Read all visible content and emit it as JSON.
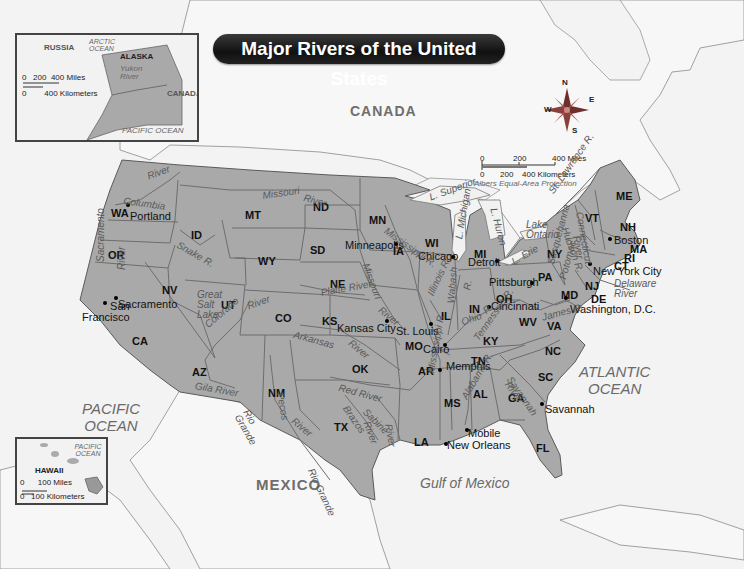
{
  "title": "Major Rivers of the United States",
  "colors": {
    "land_us": "#a9a9a9",
    "land_other": "#f6f6f6",
    "water": "#f3f3f3",
    "border": "#555555",
    "river": "#6e6e6e",
    "compass": "#8a3f3a",
    "title_bg": "#1a1a1a"
  },
  "countries": {
    "canada": "CANADA",
    "mexico": "MEXICO"
  },
  "oceans": {
    "pacific": "PACIFIC\nOCEAN",
    "atlantic": "ATLANTIC\nOCEAN",
    "gulf": "Gulf of Mexico"
  },
  "compass": {
    "n": "N",
    "e": "E",
    "s": "S",
    "w": "W"
  },
  "scale": {
    "miles_0": "0",
    "miles_200": "200",
    "miles_400": "400 Miles",
    "km_0": "0",
    "km_200": "200",
    "km_400": "400 Kilometers",
    "projection": "Albers Equal-Area Projection"
  },
  "alaska_inset": {
    "russia": "RUSSIA",
    "arctic": "ARCTIC OCEAN",
    "alaska": "ALASKA",
    "yukon": "Yukon River",
    "canada": "CANADA",
    "pacific": "PACIFIC OCEAN",
    "scale_miles": "0   200  400 Miles",
    "scale_km": "0        400 Kilometers"
  },
  "hawaii_inset": {
    "pacific": "PACIFIC OCEAN",
    "hawaii": "HAWAII",
    "scale_miles": "0      100 Miles",
    "scale_km": "0   100 Kilometers"
  },
  "states": [
    {
      "abbr": "WA",
      "x": 111,
      "y": 208
    },
    {
      "abbr": "OR",
      "x": 108,
      "y": 250
    },
    {
      "abbr": "CA",
      "x": 132,
      "y": 336
    },
    {
      "abbr": "ID",
      "x": 191,
      "y": 230
    },
    {
      "abbr": "NV",
      "x": 162,
      "y": 285
    },
    {
      "abbr": "MT",
      "x": 245,
      "y": 210
    },
    {
      "abbr": "WY",
      "x": 258,
      "y": 256
    },
    {
      "abbr": "UT",
      "x": 221,
      "y": 300
    },
    {
      "abbr": "AZ",
      "x": 192,
      "y": 367
    },
    {
      "abbr": "CO",
      "x": 275,
      "y": 313
    },
    {
      "abbr": "NM",
      "x": 268,
      "y": 388
    },
    {
      "abbr": "ND",
      "x": 313,
      "y": 202
    },
    {
      "abbr": "SD",
      "x": 310,
      "y": 245
    },
    {
      "abbr": "NE",
      "x": 330,
      "y": 279
    },
    {
      "abbr": "KS",
      "x": 322,
      "y": 316
    },
    {
      "abbr": "OK",
      "x": 352,
      "y": 364
    },
    {
      "abbr": "TX",
      "x": 334,
      "y": 422
    },
    {
      "abbr": "MN",
      "x": 369,
      "y": 215
    },
    {
      "abbr": "IA",
      "x": 393,
      "y": 246
    },
    {
      "abbr": "MO",
      "x": 405,
      "y": 341
    },
    {
      "abbr": "AR",
      "x": 418,
      "y": 366
    },
    {
      "abbr": "LA",
      "x": 414,
      "y": 437
    },
    {
      "abbr": "WI",
      "x": 425,
      "y": 238
    },
    {
      "abbr": "IL",
      "x": 441,
      "y": 311
    },
    {
      "abbr": "MI",
      "x": 474,
      "y": 249
    },
    {
      "abbr": "IN",
      "x": 469,
      "y": 304
    },
    {
      "abbr": "OH",
      "x": 496,
      "y": 294
    },
    {
      "abbr": "KY",
      "x": 483,
      "y": 336
    },
    {
      "abbr": "TN",
      "x": 471,
      "y": 356
    },
    {
      "abbr": "MS",
      "x": 444,
      "y": 398
    },
    {
      "abbr": "AL",
      "x": 473,
      "y": 389
    },
    {
      "abbr": "GA",
      "x": 508,
      "y": 393
    },
    {
      "abbr": "FL",
      "x": 536,
      "y": 443
    },
    {
      "abbr": "SC",
      "x": 538,
      "y": 372
    },
    {
      "abbr": "NC",
      "x": 545,
      "y": 346
    },
    {
      "abbr": "VA",
      "x": 547,
      "y": 321
    },
    {
      "abbr": "WV",
      "x": 519,
      "y": 317
    },
    {
      "abbr": "PA",
      "x": 538,
      "y": 272
    },
    {
      "abbr": "NY",
      "x": 547,
      "y": 249
    },
    {
      "abbr": "VT",
      "x": 585,
      "y": 213
    },
    {
      "abbr": "NH",
      "x": 620,
      "y": 222
    },
    {
      "abbr": "ME",
      "x": 616,
      "y": 191
    },
    {
      "abbr": "MA",
      "x": 630,
      "y": 244
    },
    {
      "abbr": "RI",
      "x": 624,
      "y": 253
    },
    {
      "abbr": "CT",
      "x": 614,
      "y": 261
    },
    {
      "abbr": "NJ",
      "x": 585,
      "y": 281
    },
    {
      "abbr": "DE",
      "x": 591,
      "y": 294
    },
    {
      "abbr": "MD",
      "x": 561,
      "y": 290
    }
  ],
  "cities": [
    {
      "name": "Portland",
      "x": 130,
      "y": 211,
      "dx": 128,
      "dy": 205
    },
    {
      "name": "Sacramento",
      "x": 118,
      "y": 299,
      "dx": 116,
      "dy": 298
    },
    {
      "name": "San\nFrancisco",
      "x": 82,
      "y": 301,
      "dx": 105,
      "dy": 303,
      "align": "right"
    },
    {
      "name": "Minneapolis",
      "x": 345,
      "y": 240,
      "dx": 396,
      "dy": 244
    },
    {
      "name": "Chicago",
      "x": 418,
      "y": 251,
      "dx": 453,
      "dy": 257
    },
    {
      "name": "Detroit",
      "x": 468,
      "y": 257,
      "dx": 497,
      "dy": 261
    },
    {
      "name": "Pittsburgh",
      "x": 489,
      "y": 277,
      "dx": 532,
      "dy": 283
    },
    {
      "name": "Cincinnati",
      "x": 491,
      "y": 301,
      "dx": 489,
      "dy": 307
    },
    {
      "name": "Kansas City",
      "x": 337,
      "y": 323,
      "dx": 387,
      "dy": 321
    },
    {
      "name": "St. Louis",
      "x": 396,
      "y": 326,
      "dx": 431,
      "dy": 324
    },
    {
      "name": "Cairo",
      "x": 423,
      "y": 344,
      "dx": 445,
      "dy": 345
    },
    {
      "name": "Memphis",
      "x": 446,
      "y": 361,
      "dx": 440,
      "dy": 370
    },
    {
      "name": "Mobile",
      "x": 468,
      "y": 428,
      "dx": 467,
      "dy": 430
    },
    {
      "name": "New Orleans",
      "x": 447,
      "y": 440,
      "dx": 446,
      "dy": 444
    },
    {
      "name": "Savannah",
      "x": 545,
      "y": 404,
      "dx": 542,
      "dy": 404
    },
    {
      "name": "Boston",
      "x": 614,
      "y": 235,
      "dx": 610,
      "dy": 239
    },
    {
      "name": "New York City",
      "x": 593,
      "y": 266,
      "dx": 590,
      "dy": 264
    },
    {
      "name": "Washington, D.C.",
      "x": 570,
      "y": 304,
      "dx": 566,
      "dy": 298
    }
  ],
  "rivers": [
    {
      "name": "Columbia",
      "x": 124,
      "y": 196,
      "rot": 8
    },
    {
      "name": "River",
      "x": 146,
      "y": 172,
      "rot": -20
    },
    {
      "name": "Snake R.",
      "x": 180,
      "y": 240,
      "rot": 30
    },
    {
      "name": "Missouri",
      "x": 262,
      "y": 191,
      "rot": -8
    },
    {
      "name": "River",
      "x": 305,
      "y": 193,
      "rot": 15
    },
    {
      "name": "Sacramento",
      "x": 96,
      "y": 262,
      "rot": -90
    },
    {
      "name": "River",
      "x": 117,
      "y": 270,
      "rot": -90
    },
    {
      "name": "Great\nSalt\nLake",
      "x": 197,
      "y": 290,
      "rot": 0
    },
    {
      "name": "Colorado",
      "x": 203,
      "y": 322,
      "rot": -40
    },
    {
      "name": "River",
      "x": 246,
      "y": 302,
      "rot": -20
    },
    {
      "name": "Arkansas",
      "x": 295,
      "y": 330,
      "rot": 15
    },
    {
      "name": "River",
      "x": 353,
      "y": 338,
      "rot": 40
    },
    {
      "name": "Platte River",
      "x": 320,
      "y": 288,
      "rot": -10
    },
    {
      "name": "Missouri",
      "x": 370,
      "y": 262,
      "rot": 70
    },
    {
      "name": "River",
      "x": 383,
      "y": 305,
      "rot": 40
    },
    {
      "name": "Mississippi R.",
      "x": 388,
      "y": 226,
      "rot": 35
    },
    {
      "name": "Gila River",
      "x": 196,
      "y": 381,
      "rot": 10
    },
    {
      "name": "Rio\nGrande",
      "x": 250,
      "y": 408,
      "rot": 60
    },
    {
      "name": "Pecos",
      "x": 285,
      "y": 392,
      "rot": 80
    },
    {
      "name": "River",
      "x": 296,
      "y": 416,
      "rot": 40
    },
    {
      "name": "Red River",
      "x": 340,
      "y": 383,
      "rot": 15
    },
    {
      "name": "Brazos",
      "x": 349,
      "y": 404,
      "rot": 55
    },
    {
      "name": "River",
      "x": 371,
      "y": 420,
      "rot": 70
    },
    {
      "name": "Sabine",
      "x": 368,
      "y": 407,
      "rot": 45
    },
    {
      "name": "River",
      "x": 393,
      "y": 423,
      "rot": 80
    },
    {
      "name": "Rio Grande",
      "x": 315,
      "y": 467,
      "rot": 65
    },
    {
      "name": "L. Superior",
      "x": 428,
      "y": 193,
      "rot": -20
    },
    {
      "name": "L. Michigan",
      "x": 454,
      "y": 238,
      "rot": -80
    },
    {
      "name": "L. Huron",
      "x": 498,
      "y": 207,
      "rot": 75
    },
    {
      "name": "L. Erie",
      "x": 510,
      "y": 258,
      "rot": -30
    },
    {
      "name": "Lake\nOntario",
      "x": 526,
      "y": 220,
      "rot": 0
    },
    {
      "name": "St. Lawrence R.",
      "x": 547,
      "y": 190,
      "rot": -55
    },
    {
      "name": "Illinois R.",
      "x": 426,
      "y": 293,
      "rot": -65
    },
    {
      "name": "Wabash",
      "x": 446,
      "y": 303,
      "rot": -85
    },
    {
      "name": "R.",
      "x": 462,
      "y": 289,
      "rot": -80
    },
    {
      "name": "Ohio",
      "x": 460,
      "y": 318,
      "rot": -20
    },
    {
      "name": "R.",
      "x": 481,
      "y": 308,
      "rot": -40
    },
    {
      "name": "Tennessee R.",
      "x": 472,
      "y": 337,
      "rot": -55
    },
    {
      "name": "Mississippi R.",
      "x": 426,
      "y": 372,
      "rot": -80
    },
    {
      "name": "Alabama R.",
      "x": 460,
      "y": 396,
      "rot": -60
    },
    {
      "name": "Savannah",
      "x": 513,
      "y": 375,
      "rot": 55
    },
    {
      "name": "River",
      "x": 511,
      "y": 380,
      "rot": 55
    },
    {
      "name": "Susquehanna",
      "x": 546,
      "y": 263,
      "rot": -75
    },
    {
      "name": "Hudson R.",
      "x": 569,
      "y": 226,
      "rot": 70
    },
    {
      "name": "River",
      "x": 581,
      "y": 235,
      "rot": 80
    },
    {
      "name": "Connecticut",
      "x": 584,
      "y": 211,
      "rot": 80
    },
    {
      "name": "Potomac",
      "x": 558,
      "y": 278,
      "rot": -75
    },
    {
      "name": "James R.",
      "x": 541,
      "y": 313,
      "rot": -15
    },
    {
      "name": "Delaware\nRiver",
      "x": 614,
      "y": 279,
      "rot": 0
    }
  ]
}
